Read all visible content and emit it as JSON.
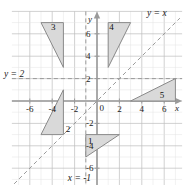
{
  "chart_data": {
    "type": "scatter",
    "title": "",
    "xlabel": "x",
    "ylabel": "y",
    "xlim": [
      -7.6,
      7.6
    ],
    "ylim": [
      -7.5,
      8.0
    ],
    "grid": true,
    "minor_grid_step": 1,
    "major_grid_step": 2,
    "legend": "none",
    "x_ticks": [
      -6,
      -4,
      -2,
      0,
      2,
      4,
      6
    ],
    "y_ticks": [
      6,
      4,
      2,
      -2,
      -4,
      -6
    ],
    "x_tick_labels": [
      "-6",
      "-4",
      "-2",
      "0",
      "2",
      "4",
      "6"
    ],
    "y_tick_labels": [
      "6",
      "4",
      "2",
      "-2",
      "-4",
      "-6"
    ],
    "origin_label": "0",
    "reference_lines": [
      {
        "name": "y-equals-x",
        "label": "y = x",
        "kind": "dashed-diagonal",
        "from": [
          -7.4,
          -7.4
        ],
        "to": [
          7.4,
          7.4
        ]
      },
      {
        "name": "y-equals-2",
        "label": "y = 2",
        "kind": "dashed-horizontal",
        "y": 2
      },
      {
        "name": "x-equals-minus-1",
        "label": "x = -1",
        "kind": "dashed-vertical",
        "x": -1
      }
    ],
    "shapes": [
      {
        "name": "triangle-1",
        "label": "1",
        "vertices": [
          [
            -1,
            -3
          ],
          [
            2,
            -3
          ],
          [
            -1,
            -5
          ]
        ],
        "label_at": [
          -0.6,
          -3.6
        ]
      },
      {
        "name": "triangle-2",
        "label": "2",
        "vertices": [
          [
            -3,
            1
          ],
          [
            -3,
            -3
          ],
          [
            -5,
            -3
          ]
        ],
        "label_at": [
          -2.6,
          -2.5
        ]
      },
      {
        "name": "triangle-3",
        "label": "3",
        "vertices": [
          [
            -5,
            7
          ],
          [
            -3,
            7
          ],
          [
            -3,
            3
          ]
        ],
        "label_at": [
          -3.9,
          6.6
        ]
      },
      {
        "name": "triangle-4",
        "label": "4",
        "vertices": [
          [
            1,
            7
          ],
          [
            3,
            7
          ],
          [
            1,
            3
          ]
        ],
        "label_at": [
          1.3,
          6.6
        ]
      },
      {
        "name": "triangle-5",
        "label": "5",
        "vertices": [
          [
            3,
            0
          ],
          [
            7,
            0
          ],
          [
            7,
            2
          ]
        ],
        "label_at": [
          5.8,
          0.55
        ]
      }
    ],
    "colors": {
      "shape_fill": "#d9d9d9",
      "shape_stroke": "#8a8a8a",
      "axis": "#9a9a9a",
      "grid_minor": "#e2e2e2",
      "grid_major": "#bdbdbd",
      "dashed_line": "#9a9a9a",
      "text": "#1a1a1a",
      "background": "#ffffff"
    }
  },
  "labels": {
    "y_axis_name": "y",
    "x_axis_name": "x",
    "line_y_eq_x": "y = x",
    "line_y_eq_2": "y = 2",
    "line_x_eq_m1": "x = -1"
  }
}
